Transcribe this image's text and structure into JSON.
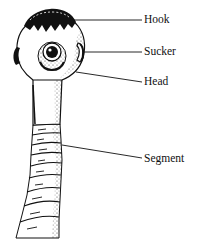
{
  "diagram": {
    "labels": [
      {
        "id": "hook",
        "text": "Hook"
      },
      {
        "id": "sucker",
        "text": "Sucker"
      },
      {
        "id": "head",
        "text": "Head"
      },
      {
        "id": "segment",
        "text": "Segment"
      }
    ]
  },
  "colors": {
    "ink": "#111111",
    "background": "#ffffff"
  }
}
